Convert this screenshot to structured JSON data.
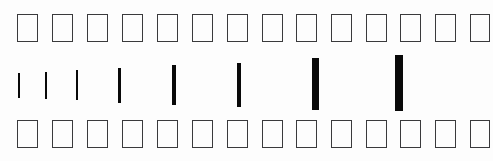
{
  "figure": {
    "title": "",
    "background_color": "#fdfdfd",
    "outline_color": "#3a3a3c",
    "bar_color": "#090909",
    "width": 493,
    "height": 161
  },
  "chart_data": {
    "type": "bar",
    "title": "",
    "subtitle": "",
    "xlabel": "",
    "ylabel": "",
    "grid": false,
    "legend": null,
    "xlim": [
      0,
      493
    ],
    "ylim": [
      0,
      161
    ],
    "annotations": [],
    "rows": [
      {
        "name": "top-row",
        "kind": "outline-rectangles",
        "count": 14,
        "description": "row of 14 hollow rectangle outlines",
        "items": [
          {
            "x": 17,
            "y": 14,
            "w": 21,
            "h": 28
          },
          {
            "x": 52,
            "y": 14,
            "w": 21,
            "h": 28
          },
          {
            "x": 87,
            "y": 14,
            "w": 21,
            "h": 28
          },
          {
            "x": 122,
            "y": 14,
            "w": 21,
            "h": 28
          },
          {
            "x": 157,
            "y": 14,
            "w": 21,
            "h": 28
          },
          {
            "x": 192,
            "y": 14,
            "w": 21,
            "h": 28
          },
          {
            "x": 227,
            "y": 14,
            "w": 21,
            "h": 28
          },
          {
            "x": 262,
            "y": 14,
            "w": 21,
            "h": 28
          },
          {
            "x": 296,
            "y": 14,
            "w": 21,
            "h": 28
          },
          {
            "x": 331,
            "y": 14,
            "w": 21,
            "h": 28
          },
          {
            "x": 366,
            "y": 14,
            "w": 21,
            "h": 28
          },
          {
            "x": 400,
            "y": 14,
            "w": 21,
            "h": 28
          },
          {
            "x": 435,
            "y": 14,
            "w": 21,
            "h": 28
          },
          {
            "x": 470,
            "y": 14,
            "w": 20,
            "h": 28
          }
        ]
      },
      {
        "name": "middle-row",
        "kind": "vertical-bars",
        "count": 8,
        "description": "eight black vertical bars increasing in width and height from left to right",
        "categories": [
          "1",
          "2",
          "3",
          "4",
          "5",
          "6",
          "7",
          "8"
        ],
        "values": [
          25,
          27,
          30,
          35,
          40,
          44,
          52,
          56
        ],
        "widths": [
          2,
          2,
          2,
          3,
          4,
          4,
          7,
          8
        ],
        "items": [
          {
            "x": 18,
            "y": 73,
            "w": 2,
            "h": 25
          },
          {
            "x": 45,
            "y": 72,
            "w": 2,
            "h": 27
          },
          {
            "x": 76,
            "y": 70,
            "w": 2,
            "h": 30
          },
          {
            "x": 118,
            "y": 68,
            "w": 3,
            "h": 35
          },
          {
            "x": 172,
            "y": 65,
            "w": 4,
            "h": 40
          },
          {
            "x": 237,
            "y": 63,
            "w": 4,
            "h": 44
          },
          {
            "x": 312,
            "y": 58,
            "w": 7,
            "h": 52
          },
          {
            "x": 395,
            "y": 55,
            "w": 8,
            "h": 56
          }
        ]
      },
      {
        "name": "bottom-row",
        "kind": "outline-rectangles",
        "count": 14,
        "description": "row of 14 hollow rectangle outlines",
        "items": [
          {
            "x": 17,
            "y": 120,
            "w": 21,
            "h": 28
          },
          {
            "x": 52,
            "y": 120,
            "w": 21,
            "h": 28
          },
          {
            "x": 87,
            "y": 120,
            "w": 21,
            "h": 28
          },
          {
            "x": 122,
            "y": 120,
            "w": 21,
            "h": 28
          },
          {
            "x": 157,
            "y": 120,
            "w": 21,
            "h": 28
          },
          {
            "x": 192,
            "y": 120,
            "w": 21,
            "h": 28
          },
          {
            "x": 227,
            "y": 120,
            "w": 21,
            "h": 28
          },
          {
            "x": 262,
            "y": 120,
            "w": 21,
            "h": 28
          },
          {
            "x": 296,
            "y": 120,
            "w": 21,
            "h": 28
          },
          {
            "x": 331,
            "y": 120,
            "w": 21,
            "h": 28
          },
          {
            "x": 366,
            "y": 120,
            "w": 21,
            "h": 28
          },
          {
            "x": 400,
            "y": 120,
            "w": 21,
            "h": 28
          },
          {
            "x": 435,
            "y": 120,
            "w": 21,
            "h": 28
          },
          {
            "x": 470,
            "y": 120,
            "w": 20,
            "h": 28
          }
        ]
      }
    ]
  }
}
